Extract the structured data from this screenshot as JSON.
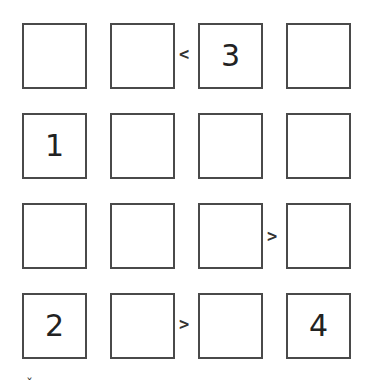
{
  "puzzle": {
    "type": "futoshiki",
    "size": 4,
    "grid": [
      [
        "",
        "",
        "3",
        ""
      ],
      [
        "1",
        "",
        "",
        ""
      ],
      [
        "",
        "",
        "",
        ""
      ],
      [
        "2",
        "",
        "",
        "4"
      ]
    ],
    "constraints": [
      {
        "row": 0,
        "between": [
          1,
          2
        ],
        "symbol": "<"
      },
      {
        "row": 2,
        "between": [
          2,
          3
        ],
        "symbol": ">"
      },
      {
        "row": 3,
        "between": [
          1,
          2
        ],
        "symbol": ">"
      }
    ]
  },
  "footer": {
    "partial_glyph": "ˇ"
  },
  "colors": {
    "border": "#4a4a4a",
    "text": "#222222",
    "background": "#ffffff"
  }
}
